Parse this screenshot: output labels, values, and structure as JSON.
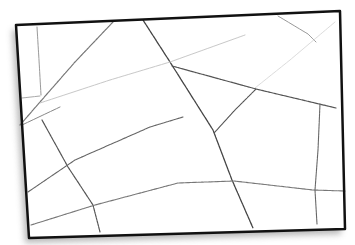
{
  "sketch": {
    "background": "#ffffff",
    "frame": {
      "points": [
        [
          16,
          25
        ],
        [
          340,
          11
        ],
        [
          345,
          229
        ],
        [
          29,
          238
        ]
      ],
      "stroke": "#111111",
      "shadow": "#9a9a9a"
    },
    "lines": [
      {
        "id": "left-vertical",
        "points": [
          [
            37,
            27
          ],
          [
            39,
            60
          ],
          [
            41,
            95
          ]
        ],
        "color": "#9a9a9a",
        "width": 1
      },
      {
        "id": "upper-left-diagonal",
        "points": [
          [
            113,
            22
          ],
          [
            75,
            62
          ],
          [
            40,
            102
          ],
          [
            20,
            125
          ]
        ],
        "color": "#777777",
        "width": 1.2
      },
      {
        "id": "short-left-dash",
        "points": [
          [
            22,
            98
          ],
          [
            40,
            96
          ]
        ],
        "color": "#aaaaaa",
        "width": 1
      },
      {
        "id": "main-diagonal",
        "points": [
          [
            143,
            20
          ],
          [
            170,
            62
          ],
          [
            213,
            130
          ],
          [
            232,
            180
          ],
          [
            253,
            228
          ]
        ],
        "color": "#444444",
        "width": 1.3
      },
      {
        "id": "faint-long-line",
        "points": [
          [
            40,
            103
          ],
          [
            110,
            80
          ],
          [
            170,
            62
          ],
          [
            245,
            35
          ]
        ],
        "color": "#c8c8c8",
        "width": 1
      },
      {
        "id": "upper-right-diagonal",
        "points": [
          [
            278,
            16
          ],
          [
            308,
            34
          ],
          [
            316,
            42
          ]
        ],
        "color": "#999999",
        "width": 1
      },
      {
        "id": "faint-right-line",
        "points": [
          [
            335,
            22
          ],
          [
            290,
            60
          ],
          [
            255,
            88
          ]
        ],
        "color": "#dcdcdc",
        "width": 1
      },
      {
        "id": "mid-right-line",
        "points": [
          [
            172,
            66
          ],
          [
            256,
            89
          ],
          [
            336,
            108
          ]
        ],
        "color": "#555555",
        "width": 1.2
      },
      {
        "id": "short-connector",
        "points": [
          [
            256,
            89
          ],
          [
            235,
            110
          ],
          [
            214,
            133
          ]
        ],
        "color": "#555555",
        "width": 1.1
      },
      {
        "id": "left-lower-diagonal",
        "points": [
          [
            42,
            120
          ],
          [
            68,
            167
          ],
          [
            93,
            205
          ],
          [
            100,
            232
          ]
        ],
        "color": "#555555",
        "width": 1.2
      },
      {
        "id": "left-middle-line",
        "points": [
          [
            22,
            125
          ],
          [
            60,
            107
          ]
        ],
        "color": "#888888",
        "width": 1
      },
      {
        "id": "middle-left-line",
        "points": [
          [
            28,
            192
          ],
          [
            75,
            160
          ],
          [
            150,
            127
          ],
          [
            183,
            117
          ]
        ],
        "color": "#666666",
        "width": 1.1
      },
      {
        "id": "lower-long-line",
        "points": [
          [
            31,
            225
          ],
          [
            95,
            205
          ],
          [
            178,
            183
          ],
          [
            234,
            181
          ],
          [
            313,
            190
          ],
          [
            345,
            191
          ]
        ],
        "color": "#777777",
        "width": 1.1
      },
      {
        "id": "right-vertical",
        "points": [
          [
            320,
            104
          ],
          [
            318,
            150
          ],
          [
            315,
            190
          ],
          [
            317,
            224
          ]
        ],
        "color": "#666666",
        "width": 1.1
      }
    ]
  }
}
